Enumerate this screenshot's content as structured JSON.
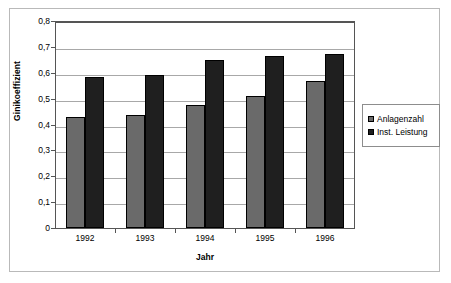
{
  "chart_data": {
    "type": "bar",
    "title": "",
    "subtitle": "",
    "xlabel": "Jahr",
    "ylabel": "Ginikoeffizient",
    "categories": [
      "1992",
      "1993",
      "1994",
      "1995",
      "1996"
    ],
    "series": [
      {
        "name": "Anlagenzahl",
        "color": "#6a6a6a",
        "values": [
          0.428,
          0.435,
          0.475,
          0.512,
          0.57
        ]
      },
      {
        "name": "Inst. Leistung",
        "color": "#1f1f1f",
        "values": [
          0.582,
          0.59,
          0.648,
          0.663,
          0.673
        ]
      }
    ],
    "ylim": [
      0,
      0.8
    ],
    "ytick_values": [
      0,
      0.1,
      0.2,
      0.3,
      0.4,
      0.5,
      0.6,
      0.7,
      0.8
    ],
    "ytick_labels": [
      "0",
      "0,1",
      "0,2",
      "0,3",
      "0,4",
      "0,5",
      "0,6",
      "0,7",
      "0,8"
    ],
    "grid": "horizontal",
    "legend_position": "right",
    "decimal_separator": ","
  },
  "legend": {
    "items": [
      {
        "label": "Anlagenzahl"
      },
      {
        "label": "Inst. Leistung"
      }
    ]
  }
}
